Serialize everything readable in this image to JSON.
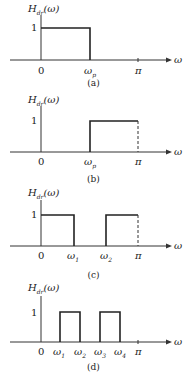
{
  "diagram": {
    "y_label": "H_dr(ω)",
    "y_label_main": "H",
    "y_label_sub": "dr",
    "y_label_arg": "(ω)",
    "x_label": "ω",
    "level_label": "1",
    "origin_label": "0",
    "pi_label": "π",
    "panels": [
      {
        "caption": "(a)",
        "type": "lowpass",
        "ticks": [
          {
            "label": "ω",
            "sub": "p"
          }
        ],
        "bands": [
          {
            "from": "0",
            "to": "ωp"
          }
        ]
      },
      {
        "caption": "(b)",
        "type": "highpass",
        "ticks": [
          {
            "label": "ω",
            "sub": "p"
          }
        ],
        "bands": [
          {
            "from": "ωp",
            "to": "π"
          }
        ]
      },
      {
        "caption": "(c)",
        "type": "bandstop",
        "ticks": [
          {
            "label": "ω",
            "sub": "1"
          },
          {
            "label": "ω",
            "sub": "2"
          }
        ],
        "bands": [
          {
            "from": "0",
            "to": "ω1"
          },
          {
            "from": "ω2",
            "to": "π"
          }
        ]
      },
      {
        "caption": "(d)",
        "type": "multiband",
        "ticks": [
          {
            "label": "ω",
            "sub": "1"
          },
          {
            "label": "ω",
            "sub": "2"
          },
          {
            "label": "ω",
            "sub": "3"
          },
          {
            "label": "ω",
            "sub": "4"
          }
        ],
        "bands": [
          {
            "from": "ω1",
            "to": "ω2"
          },
          {
            "from": "ω3",
            "to": "ω4"
          }
        ]
      }
    ]
  }
}
